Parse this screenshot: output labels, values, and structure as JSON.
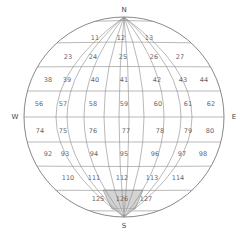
{
  "diagram": {
    "type": "globe-grid",
    "compass": {
      "north": "N",
      "south": "S",
      "east": "E",
      "west": "W"
    },
    "highlight_color": "#d4d4d4",
    "line_color": "#8a8a8a",
    "highlighted_cell": "126",
    "rows": [
      {
        "cells": [
          "11",
          "12",
          "13"
        ],
        "y": 38
      },
      {
        "cells": [
          "23",
          "24",
          "25",
          "26",
          "27"
        ],
        "y": 57
      },
      {
        "cells": [
          "38",
          "39",
          "40",
          "41",
          "42",
          "43",
          "44"
        ],
        "y": 80
      },
      {
        "cells": [
          "56",
          "57",
          "58",
          "59",
          "60",
          "61",
          "62"
        ],
        "y": 104
      },
      {
        "cells": [
          "74",
          "75",
          "76",
          "77",
          "78",
          "79",
          "80"
        ],
        "y": 130
      },
      {
        "cells": [
          "92",
          "93",
          "94",
          "95",
          "96",
          "97",
          "98"
        ],
        "y": 154
      },
      {
        "cells": [
          "110",
          "111",
          "112",
          "113",
          "114"
        ],
        "y": 178
      },
      {
        "cells": [
          "125",
          "126",
          "127"
        ],
        "y": 199
      }
    ]
  }
}
